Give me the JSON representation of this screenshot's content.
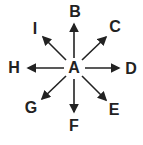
{
  "diagram": {
    "center": {
      "label": "A",
      "x": 74,
      "y": 68
    },
    "nodes": [
      {
        "id": "B",
        "label": "B",
        "x": 75,
        "y": 12
      },
      {
        "id": "C",
        "label": "C",
        "x": 115,
        "y": 27
      },
      {
        "id": "D",
        "label": "D",
        "x": 131,
        "y": 69
      },
      {
        "id": "E",
        "label": "E",
        "x": 114,
        "y": 110
      },
      {
        "id": "F",
        "label": "F",
        "x": 74,
        "y": 126
      },
      {
        "id": "G",
        "label": "G",
        "x": 31,
        "y": 108
      },
      {
        "id": "H",
        "label": "H",
        "x": 14,
        "y": 68
      },
      {
        "id": "I",
        "label": "I",
        "x": 35,
        "y": 29
      }
    ],
    "arrow_color": "#222222"
  }
}
